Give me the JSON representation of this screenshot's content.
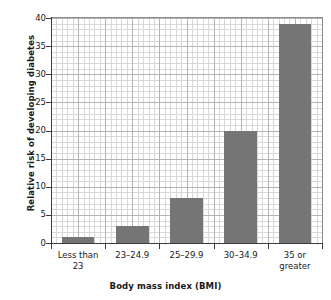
{
  "chart_data": {
    "type": "bar",
    "title": "",
    "xlabel": "Body mass index (BMI)",
    "ylabel": "Relative risk of developing diabetes",
    "categories": [
      "Less than 23",
      "23–24.9",
      "25–29.9",
      "30–34.9",
      "35 or greater"
    ],
    "category_lines": [
      [
        "Less than",
        "23"
      ],
      [
        "23–24.9",
        ""
      ],
      [
        "25–29.9",
        ""
      ],
      [
        "30–34.9",
        ""
      ],
      [
        "35 or",
        "greater"
      ]
    ],
    "values": [
      1,
      3,
      8,
      20,
      39
    ],
    "ylim": [
      0,
      40
    ],
    "yticks": [
      0,
      5,
      10,
      15,
      20,
      25,
      30,
      35,
      40
    ],
    "ytick_labels": [
      "0",
      "5",
      "10",
      "15",
      "20",
      "25",
      "30",
      "35",
      "40"
    ],
    "y_major_step": 5,
    "y_minor_step": 1,
    "grid": true,
    "grid_minor": true,
    "legend": "none",
    "bar_color": "#757575",
    "grid_color": "#d8d8d8",
    "grid_major_color": "#b4b4b4",
    "axis_color": "#3c3c3c",
    "background": "#ffffff"
  }
}
